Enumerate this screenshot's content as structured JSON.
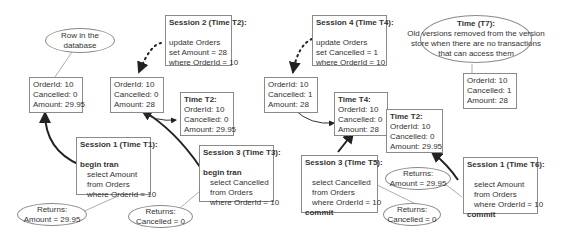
{
  "callouts": {
    "row_in_db": [
      "Row in the",
      "database"
    ],
    "t7": {
      "title": "Time (T7):",
      "lines": [
        "Old versions removed from the version",
        "store when there are no transactions",
        "that can access them"
      ]
    },
    "returns_s1_t1": [
      "Returns:",
      "Amount = 29.95"
    ],
    "returns_s3_t3": [
      "Returns:",
      "Cancelled = 0"
    ],
    "returns_s3_t5": [
      "Returns:",
      "Cancelled = 0"
    ],
    "returns_s1_t6": [
      "Returns:",
      "Amount = 29.95"
    ]
  },
  "versions": {
    "v1_original": [
      "OrderId: 10",
      "Cancelled: 0",
      "Amount: 29.95"
    ],
    "v2_current": [
      "OrderId: 10",
      "Cancelled: 0",
      "Amount: 28"
    ],
    "v2_store_t2": {
      "title": "Time T2:",
      "lines": [
        "OrderId: 10",
        "Cancelled: 0",
        "Amount: 29.95"
      ]
    },
    "v3_current": [
      "OrderId: 10",
      "Cancelled: 1",
      "Amount: 28"
    ],
    "v3_store_t4": {
      "title": "Time T4:",
      "lines": [
        "OrderId: 10",
        "Cancelled: 0",
        "Amount: 28"
      ]
    },
    "v3_store_t2": {
      "title": "Time T2:",
      "lines": [
        "OrderId: 10",
        "Cancelled: 0",
        "Amount: 29.95"
      ]
    },
    "v4_final": [
      "OrderId: 10",
      "Cancelled: 1",
      "Amount: 28"
    ]
  },
  "sessions": {
    "s1_t1": {
      "title": "Session 1 (Time T1):",
      "begin": "begin tran",
      "lines": [
        "select Amount",
        "from Orders",
        "where OrderId = 10"
      ]
    },
    "s2_t2": {
      "title": "Session 2 (Time T2):",
      "lines": [
        "update Orders",
        "set Amount = 28",
        "where OrderId = 10"
      ]
    },
    "s3_t3": {
      "title": "Session 3 (Time T3):",
      "begin": "begin tran",
      "lines": [
        "select Cancelled",
        "from Orders",
        "where OrderId = 10"
      ]
    },
    "s4_t4": {
      "title": "Session 4 (Time T4):",
      "lines": [
        "update Orders",
        "set Cancelled = 1",
        "where OrderId = 10"
      ]
    },
    "s3_t5": {
      "title": "Session 3 (Time T5):",
      "lines": [
        "select Cancelled",
        "from Orders",
        "where OrderId = 10"
      ],
      "end": "commit"
    },
    "s1_t6": {
      "title": "Session 1 (Time T6):",
      "lines": [
        "select Amount",
        "from Orders",
        "where OrderId = 10"
      ],
      "end": "commit"
    }
  }
}
